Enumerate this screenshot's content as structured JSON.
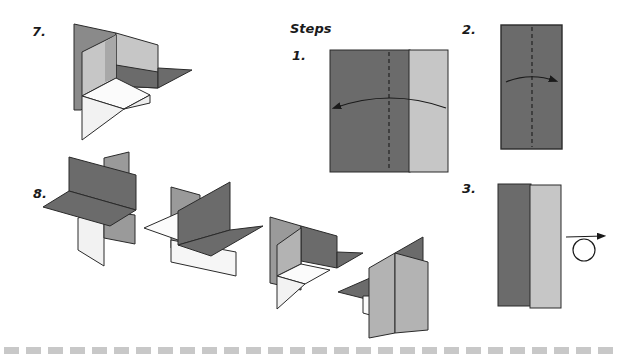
{
  "title": "Steps",
  "steps": [
    {
      "number": "1.",
      "description": "Square sheet, dark and light halves, fold along dashed center line toward left"
    },
    {
      "number": "2.",
      "description": "Folded rectangle, fold along dashed center line toward right"
    },
    {
      "number": "3.",
      "description": "Folded strip with dark and light halves, turn over"
    },
    {
      "number": "7.",
      "description": "Assembled corner unit with three perpendicular planes"
    },
    {
      "number": "8.",
      "description": "Sequence of four perpendicular plane assemblies"
    }
  ],
  "labels": {
    "steps_heading": "Steps",
    "step1": "1.",
    "step2": "2.",
    "step3": "3.",
    "step7": "7.",
    "step8": "8."
  },
  "colors": {
    "dark": "#6b6b6b",
    "medium": "#999999",
    "light": "#c6c6c6",
    "white_face": "#fbfbfb",
    "outline": "#2a2a2a",
    "dash_border": "#c8c8c8"
  },
  "footer": {
    "dash_count": 28
  }
}
